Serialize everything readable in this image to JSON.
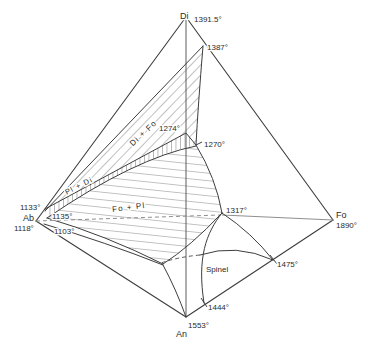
{
  "apexes": {
    "di": {
      "label": "Di",
      "temp": "1391.5°"
    },
    "ab": {
      "label": "Ab",
      "temp": "1118°"
    },
    "fo": {
      "label": "Fo",
      "temp": "1890°"
    },
    "an": {
      "label": "An",
      "temp": "1553°"
    }
  },
  "points": {
    "t1387": "1387°",
    "t1274": "1274°",
    "t1270": "1270°",
    "t1133": "1133°",
    "t1135": "1135°",
    "t1103": "1103°",
    "t1317": "1317°",
    "t1475": "1475°",
    "t1444": "1444°"
  },
  "regions": {
    "di_fo": "Di + Fo",
    "pl_di": "Pl + Di",
    "fo_pl": "Fo + Pl",
    "spinel": "Spinel"
  },
  "colors": {
    "edge_line": "#3d3d3d",
    "join_line": "#8f8f8f",
    "hatch_line": "#4d4d4d",
    "text": "#2b2b2b",
    "background": "#ffffff"
  }
}
